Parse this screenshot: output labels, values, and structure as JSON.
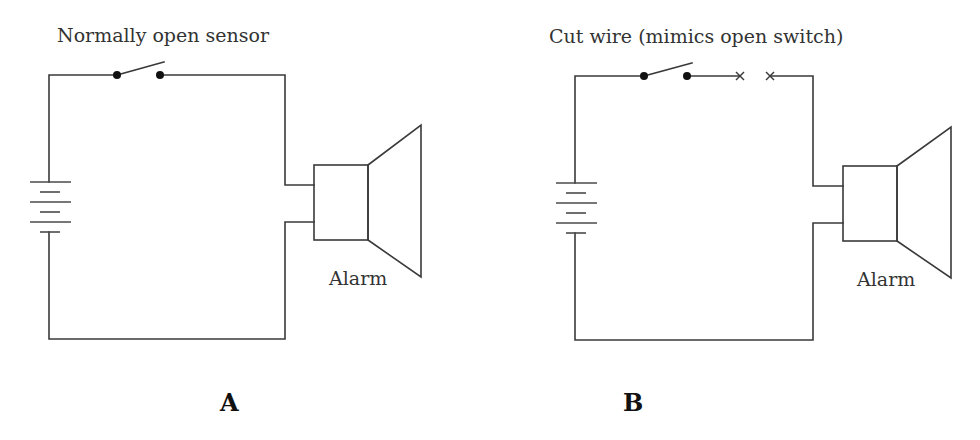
{
  "panels": [
    {
      "id": "A",
      "caption": "Normally open sensor",
      "alarm_label": "Alarm",
      "panel_letter": "A",
      "has_cut_wire": false
    },
    {
      "id": "B",
      "caption": "Cut wire (mimics open switch)",
      "alarm_label": "Alarm",
      "panel_letter": "B",
      "has_cut_wire": true
    }
  ],
  "components": {
    "battery": "battery-icon",
    "switch": "open-switch-icon",
    "alarm": "speaker-alarm-icon",
    "cut_marks": "x-cut-mark-icon"
  },
  "colors": {
    "wire": "#3a3a3a",
    "text": "#333333",
    "background": "#ffffff"
  }
}
